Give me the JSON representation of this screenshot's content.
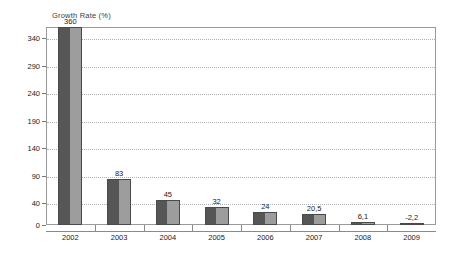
{
  "chart_data": {
    "type": "bar",
    "title": "Growth Rate (%)",
    "xlabel": "",
    "ylabel": "Growth Rate (%)",
    "categories": [
      "2002",
      "2003",
      "2004",
      "2005",
      "2006",
      "2007",
      "2008",
      "2009"
    ],
    "values": [
      360,
      83,
      45,
      32,
      24,
      20.5,
      6.1,
      -2.2
    ],
    "value_labels": [
      "360",
      "83",
      "45",
      "32",
      "24",
      "20,5",
      "6,1",
      "-2,2"
    ],
    "ylim": [
      0,
      360
    ],
    "yticks": [
      0,
      40,
      90,
      140,
      190,
      240,
      290,
      340
    ],
    "ytick_labels": [
      "0",
      "40",
      "90",
      "140",
      "190",
      "240",
      "290",
      "340"
    ],
    "grid": true,
    "grid_style": "dotted-horizontal",
    "legend": false,
    "legend_position": "none",
    "bar_fill_dark": "#565656",
    "bar_fill_light": "#9d9d9d",
    "bar_border": "#4a4a4a",
    "frame_color": "#9a9a9a",
    "gridline_color": "#b0b0b0",
    "background": "#ffffff",
    "text_color": "#1a1a1a"
  }
}
